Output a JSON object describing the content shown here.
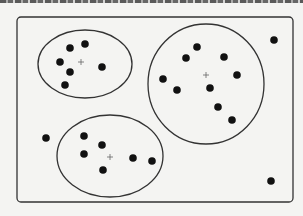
{
  "diagram": {
    "type": "clustering-illustration",
    "frame": {
      "x": 17,
      "y": 17,
      "width": 276,
      "height": 185,
      "radius": 4
    },
    "colors": {
      "stroke": "#333333",
      "point": "#111111",
      "background": "#f4f4f2"
    },
    "clusters": [
      {
        "name": "cluster-top-left",
        "shape": "ellipse",
        "cx": 85,
        "cy": 64,
        "rx": 47,
        "ry": 34,
        "centroid": {
          "x": 81,
          "y": 62
        },
        "points": [
          [
            70,
            48
          ],
          [
            85,
            44
          ],
          [
            60,
            62
          ],
          [
            70,
            72
          ],
          [
            102,
            67
          ],
          [
            65,
            85
          ]
        ]
      },
      {
        "name": "cluster-right",
        "shape": "ellipse",
        "cx": 206,
        "cy": 84,
        "rx": 58,
        "ry": 60,
        "centroid": {
          "x": 206,
          "y": 75
        },
        "points": [
          [
            197,
            47
          ],
          [
            186,
            58
          ],
          [
            224,
            57
          ],
          [
            163,
            79
          ],
          [
            237,
            75
          ],
          [
            177,
            90
          ],
          [
            210,
            88
          ],
          [
            218,
            107
          ],
          [
            232,
            120
          ]
        ]
      },
      {
        "name": "cluster-bottom",
        "shape": "ellipse",
        "cx": 110,
        "cy": 156,
        "rx": 53,
        "ry": 41,
        "centroid": {
          "x": 110,
          "y": 157
        },
        "points": [
          [
            84,
            136
          ],
          [
            102,
            145
          ],
          [
            84,
            154
          ],
          [
            133,
            158
          ],
          [
            152,
            161
          ],
          [
            103,
            170
          ]
        ]
      }
    ],
    "outliers": [
      [
        274,
        40
      ],
      [
        46,
        138
      ],
      [
        271,
        181
      ]
    ]
  }
}
